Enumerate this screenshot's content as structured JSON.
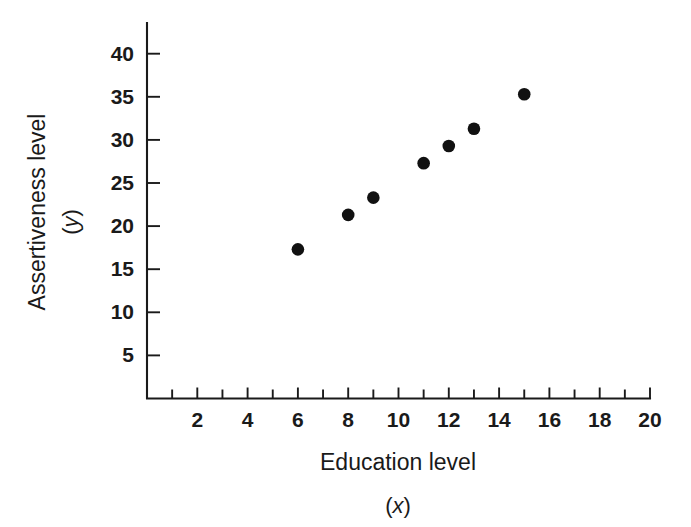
{
  "chart_data": {
    "type": "scatter",
    "title": "",
    "xlabel": "Education level",
    "xvar": "(x)",
    "ylabel": "Assertiveness level",
    "yvar": "(y)",
    "xlim": [
      0,
      20
    ],
    "ylim": [
      0,
      43
    ],
    "xticks": [
      2,
      4,
      6,
      8,
      10,
      12,
      14,
      16,
      18,
      20
    ],
    "xtick_labels": [
      "2",
      "4",
      "6",
      "8",
      "10",
      "12",
      "14",
      "16",
      "18",
      "20"
    ],
    "xminor_ticks": [
      1,
      3,
      5,
      7,
      9,
      11,
      13,
      15,
      17,
      19
    ],
    "yticks": [
      5,
      10,
      15,
      20,
      25,
      30,
      35,
      40
    ],
    "ytick_labels": [
      "5",
      "10",
      "15",
      "20",
      "25",
      "30",
      "35",
      "40"
    ],
    "grid": false,
    "legend": null,
    "marker": "filled-circle",
    "marker_color": "#111111",
    "points": [
      {
        "x": 6,
        "y": 17.3
      },
      {
        "x": 8,
        "y": 21.3
      },
      {
        "x": 9,
        "y": 23.3
      },
      {
        "x": 11,
        "y": 27.3
      },
      {
        "x": 12,
        "y": 29.3
      },
      {
        "x": 13,
        "y": 31.3
      },
      {
        "x": 15,
        "y": 35.3
      }
    ]
  }
}
